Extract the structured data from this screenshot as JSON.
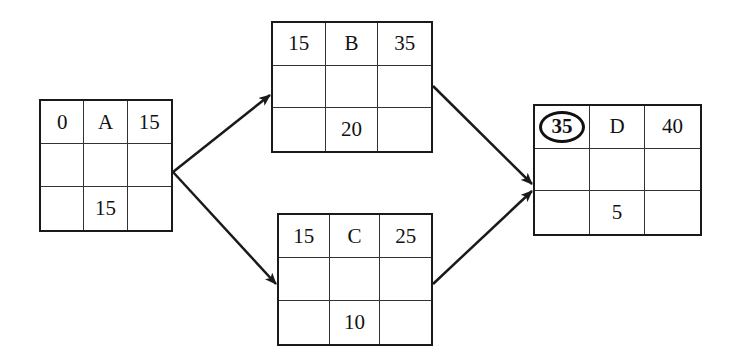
{
  "diagram": {
    "type": "activity-on-node network (critical path method)",
    "cell_layout": [
      [
        "earliest_start",
        "name",
        "earliest_finish"
      ],
      [
        "",
        "",
        ""
      ],
      [
        "",
        "duration",
        ""
      ]
    ],
    "nodes": [
      {
        "id": "A",
        "name": "A",
        "es": "0",
        "ef": "15",
        "duration": "15",
        "highlight_es": false
      },
      {
        "id": "B",
        "name": "B",
        "es": "15",
        "ef": "35",
        "duration": "20",
        "highlight_es": false
      },
      {
        "id": "C",
        "name": "C",
        "es": "15",
        "ef": "25",
        "duration": "10",
        "highlight_es": false
      },
      {
        "id": "D",
        "name": "D",
        "es": "35",
        "ef": "40",
        "duration": "5",
        "highlight_es": true
      }
    ],
    "edges": [
      {
        "from": "A",
        "to": "B"
      },
      {
        "from": "A",
        "to": "C"
      },
      {
        "from": "B",
        "to": "D"
      },
      {
        "from": "C",
        "to": "D"
      }
    ],
    "colors": {
      "line": "#1a1a1a",
      "background": "#ffffff"
    }
  }
}
